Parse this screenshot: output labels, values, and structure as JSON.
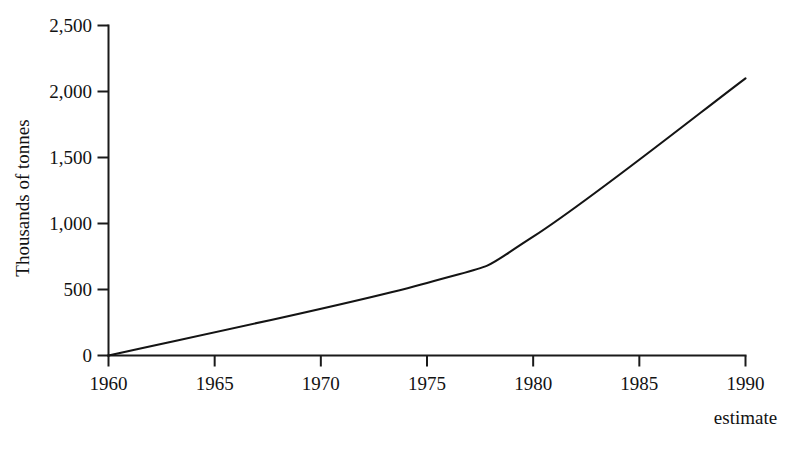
{
  "chart_data": {
    "type": "line",
    "title": "",
    "subtitle": "",
    "xlabel": "",
    "ylabel": "Thousands of tonnes",
    "x": [
      1960,
      1975,
      1980,
      1990
    ],
    "values": [
      0,
      550,
      900,
      2100
    ],
    "series": [
      {
        "name": "Production",
        "values": [
          0,
          550,
          900,
          2100
        ]
      }
    ],
    "categories": [
      "1960",
      "1975",
      "1980",
      "1990"
    ],
    "xlim": [
      1960,
      1990
    ],
    "ylim": [
      0,
      2500
    ],
    "xticks": [
      1960,
      1965,
      1970,
      1975,
      1980,
      1985,
      1990
    ],
    "xtick_labels": [
      "1960",
      "1965",
      "1970",
      "1975",
      "1980",
      "1985",
      "1990"
    ],
    "yticks": [
      0,
      500,
      1000,
      1500,
      2000,
      2500
    ],
    "ytick_labels": [
      "0",
      "500",
      "1,000",
      "1,500",
      "2,000",
      "2,500"
    ],
    "grid": false,
    "legend": false,
    "legend_position": "none",
    "annotations": [
      {
        "text": "estimate",
        "x": 1990,
        "position": "below-axis-right"
      }
    ],
    "line_color": "#141414",
    "background_color": "#ffffff"
  }
}
